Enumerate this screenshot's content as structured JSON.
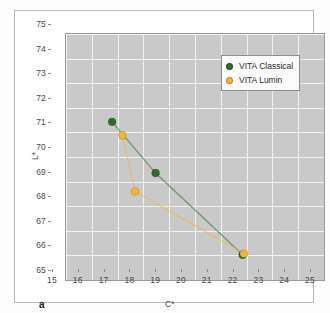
{
  "figure": {
    "panel_label": "a"
  },
  "legend": {
    "position": "top-right",
    "entries": [
      {
        "label": "VITA Classical",
        "color": "#2f6b2e",
        "marker": "circle"
      },
      {
        "label": "VITA Lumin",
        "color": "#f4b532",
        "marker": "circle"
      }
    ]
  },
  "chart_data": {
    "type": "line",
    "title": "",
    "subtitle": "",
    "xlabel": "C*",
    "ylabel": "L*",
    "xlim": [
      15,
      25
    ],
    "ylim": [
      65,
      75
    ],
    "xticks": [
      15,
      16,
      17,
      18,
      19,
      20,
      21,
      22,
      23,
      24,
      25
    ],
    "yticks": [
      65,
      66,
      67,
      68,
      69,
      70,
      71,
      72,
      73,
      74,
      75
    ],
    "xtick_labels": [
      "15",
      "16",
      "17",
      "18",
      "19",
      "20",
      "21",
      "22",
      "23",
      "24",
      "25"
    ],
    "ytick_labels": [
      "65",
      "66",
      "67",
      "68",
      "69",
      "70",
      "71",
      "72",
      "73",
      "74",
      "75"
    ],
    "grid": true,
    "grid_color": "#f2f2f2",
    "plot_background": "#c9c9c9",
    "legend_position": "top-right",
    "annotations": [
      "a"
    ],
    "series": [
      {
        "name": "VITA Classical",
        "color": "#2f6b2e",
        "marker": "circle",
        "points": [
          {
            "x": 16.8,
            "y": 71.4
          },
          {
            "x": 18.5,
            "y": 69.3
          },
          {
            "x": 21.9,
            "y": 65.95
          }
        ]
      },
      {
        "name": "VITA Lumin",
        "color": "#f4b532",
        "marker": "circle",
        "points": [
          {
            "x": 17.2,
            "y": 70.85
          },
          {
            "x": 17.7,
            "y": 68.55
          },
          {
            "x": 21.95,
            "y": 66.0
          }
        ]
      }
    ]
  }
}
